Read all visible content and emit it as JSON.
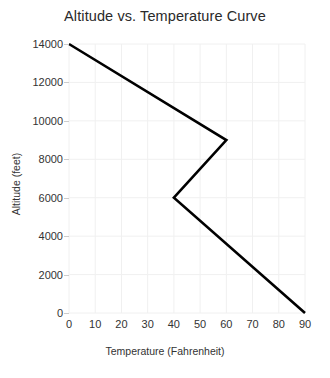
{
  "chart_data": {
    "type": "line",
    "title": "Altitude vs. Temperature Curve",
    "xlabel": "Temperature (Fahrenheit)",
    "ylabel": "Altitude (feet)",
    "xlim": [
      0,
      90
    ],
    "ylim": [
      0,
      14000
    ],
    "xticks": [
      0,
      10,
      20,
      30,
      40,
      50,
      60,
      70,
      80,
      90
    ],
    "yticks": [
      0,
      2000,
      4000,
      6000,
      8000,
      10000,
      12000,
      14000
    ],
    "xtick_labels": [
      "0",
      "10",
      "20",
      "30",
      "40",
      "50",
      "60",
      "70",
      "80",
      "90"
    ],
    "ytick_labels": [
      "0",
      "2000",
      "4000",
      "6000",
      "8000",
      "10000",
      "12000",
      "14000"
    ],
    "grid": true,
    "legend": null,
    "series": [
      {
        "name": "altitude-temperature-curve",
        "color": "#000000",
        "line_width": 2.6,
        "x": [
          0,
          60,
          40,
          90
        ],
        "y": [
          14000,
          9000,
          6000,
          0
        ],
        "points": [
          {
            "temperature": 0,
            "altitude": 14000
          },
          {
            "temperature": 60,
            "altitude": 9000
          },
          {
            "temperature": 40,
            "altitude": 6000
          },
          {
            "temperature": 90,
            "altitude": 0
          }
        ]
      }
    ]
  },
  "colors": {
    "background": "#ffffff",
    "grid": "#f0f0f0",
    "line": "#000000",
    "text": "#333333",
    "title": "#2a2a2a"
  }
}
